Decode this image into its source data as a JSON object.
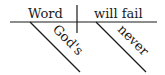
{
  "diagram": {
    "type": "sentence-diagram",
    "subject": "Word",
    "predicate": "will fail",
    "subject_modifier": "God's",
    "predicate_modifier": "never",
    "line_color": "#1a1a1a"
  }
}
